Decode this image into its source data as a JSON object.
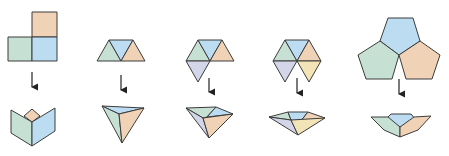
{
  "diagram": {
    "colors": {
      "orange": "#f0d2b7",
      "blue": "#bcdcf2",
      "green": "#c6e0d4",
      "lavender": "#d2d6e8",
      "yellow": "#f2e4b6",
      "edge": "#3c3c3c",
      "arrow": "#222222"
    },
    "columns": [
      {
        "id": "squares",
        "net": "three squares",
        "folded": "cube corner"
      },
      {
        "id": "three-triangles",
        "net": "three triangles",
        "folded": "tetrahedron corner"
      },
      {
        "id": "four-triangles",
        "net": "four triangles",
        "folded": "octahedron corner"
      },
      {
        "id": "five-triangles",
        "net": "five triangles",
        "folded": "icosahedron corner"
      },
      {
        "id": "pentagons",
        "net": "three pentagons",
        "folded": "dodecahedron corner"
      }
    ]
  }
}
